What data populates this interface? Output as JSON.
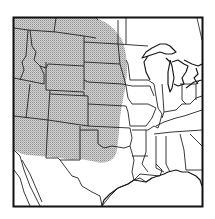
{
  "map": {
    "title": "",
    "region": "Central and Western United States",
    "style": "black-and-white line map with stippled range shading",
    "colors": {
      "background": "#ffffff",
      "border": "#1a1a1a",
      "state_lines": "#2a2a2a",
      "range_fill": "#c8c8c8",
      "range_stipple": "#9a9a9a"
    },
    "frame": {
      "x": 13,
      "y": 17,
      "width": 190,
      "height": 190
    },
    "shaded_range": {
      "label": "Distribution range",
      "description": "Stippled area covering the western Great Plains and Rocky Mountain states, eastern edge roughly along central Dakotas, Nebraska, Kansas and western Oklahoma, south to northern Texas panhandle"
    }
  }
}
